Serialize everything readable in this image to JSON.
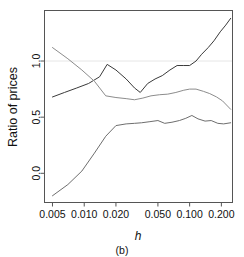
{
  "figure": {
    "panel_label": "(b)",
    "background": "#ffffff",
    "box_color": "#555555"
  },
  "chart_data": {
    "type": "line",
    "title": "",
    "subtitle": "",
    "panel": "(b)",
    "xlabel": "h",
    "ylabel": "Ratio of prices",
    "xscale": "log",
    "yscale": "linear",
    "grid": false,
    "legend": "none",
    "xlim": [
      0.0042,
      0.255
    ],
    "ylim": [
      -0.26,
      1.45
    ],
    "xticks": [
      0.005,
      0.01,
      0.02,
      0.05,
      0.1,
      0.2
    ],
    "xtick_labels": [
      "0.005",
      "0.010",
      "0.020",
      "0.050",
      "0.100",
      "0.200"
    ],
    "yticks": [
      0.0,
      0.5,
      1.0
    ],
    "ytick_labels": [
      "0.0",
      "0.5",
      "1.0"
    ],
    "reference_lines": [
      {
        "name": "unity-reference-line",
        "y": 1.0,
        "color": "#e6e6e6",
        "style": "solid"
      }
    ],
    "series": [
      {
        "name": "rising-upper-curve",
        "color": "#3a3a3a",
        "width": 1.0,
        "x": [
          0.005,
          0.0065,
          0.0085,
          0.011,
          0.014,
          0.0165,
          0.02,
          0.025,
          0.03,
          0.034,
          0.04,
          0.047,
          0.055,
          0.065,
          0.076,
          0.087,
          0.1,
          0.115,
          0.13,
          0.15,
          0.17,
          0.195,
          0.22,
          0.245
        ],
        "y": [
          0.68,
          0.72,
          0.76,
          0.8,
          0.86,
          0.97,
          0.92,
          0.84,
          0.76,
          0.72,
          0.8,
          0.84,
          0.87,
          0.92,
          0.96,
          0.96,
          0.96,
          1.0,
          1.06,
          1.12,
          1.18,
          1.26,
          1.32,
          1.38
        ]
      },
      {
        "name": "descending-middle-curve",
        "color": "#8c8c8c",
        "width": 1.0,
        "x": [
          0.005,
          0.007,
          0.0095,
          0.0125,
          0.016,
          0.02,
          0.025,
          0.03,
          0.036,
          0.043,
          0.052,
          0.062,
          0.074,
          0.088,
          0.1,
          0.115,
          0.135,
          0.155,
          0.18,
          0.205,
          0.245
        ],
        "y": [
          1.12,
          1.02,
          0.92,
          0.82,
          0.69,
          0.675,
          0.665,
          0.655,
          0.67,
          0.69,
          0.7,
          0.705,
          0.72,
          0.74,
          0.75,
          0.75,
          0.73,
          0.71,
          0.68,
          0.645,
          0.57
        ]
      },
      {
        "name": "rising-lower-curve",
        "color": "#6e6e6e",
        "width": 1.0,
        "x": [
          0.005,
          0.007,
          0.0095,
          0.0125,
          0.016,
          0.02,
          0.025,
          0.03,
          0.035,
          0.042,
          0.05,
          0.058,
          0.068,
          0.08,
          0.092,
          0.105,
          0.12,
          0.14,
          0.16,
          0.185,
          0.21,
          0.245
        ],
        "y": [
          -0.2,
          -0.1,
          0.02,
          0.18,
          0.33,
          0.425,
          0.44,
          0.445,
          0.45,
          0.46,
          0.47,
          0.445,
          0.455,
          0.47,
          0.49,
          0.515,
          0.485,
          0.465,
          0.47,
          0.445,
          0.44,
          0.45
        ]
      }
    ]
  }
}
